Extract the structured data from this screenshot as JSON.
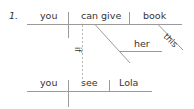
{
  "diagram": {
    "number": "1.",
    "main_clause": {
      "subject": "you",
      "verb": "can give",
      "object": "book",
      "object_modifier": "this",
      "indirect_object": "her"
    },
    "subordinate_clause": {
      "connector": "if",
      "subject": "you",
      "verb": "see",
      "object": "Lola"
    }
  },
  "colors": {
    "line": "#9a9a9a",
    "text": "#333333"
  }
}
